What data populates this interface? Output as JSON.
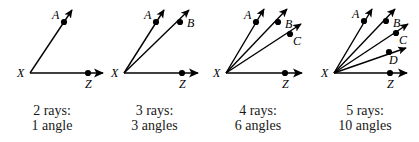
{
  "figure": {
    "background_color": "#ffffff",
    "stroke_color": "#000000",
    "panels": [
      {
        "id": "panel-1",
        "x_offset": 0,
        "width": 104,
        "vertex_label": "X",
        "vertex": {
          "x": 30,
          "y": 73
        },
        "rays": [
          {
            "label": "A",
            "dot": {
              "x": 64,
              "y": 22
            },
            "tip": {
              "x": 72,
              "y": 10
            },
            "label_pos": {
              "x": 52,
              "y": 19
            }
          },
          {
            "label": "Z",
            "dot": {
              "x": 88,
              "y": 73
            },
            "tip": {
              "x": 103,
              "y": 73
            },
            "label_pos": {
              "x": 85,
              "y": 88
            }
          }
        ],
        "caption_line1": "2 rays:",
        "caption_line2": "1 angle",
        "ray_count": 2,
        "angle_count": 1
      },
      {
        "id": "panel-2",
        "x_offset": 104,
        "width": 101,
        "vertex_label": "X",
        "vertex": {
          "x": 20,
          "y": 73
        },
        "rays": [
          {
            "label": "A",
            "dot": {
              "x": 52,
              "y": 22
            },
            "tip": {
              "x": 60,
              "y": 10
            },
            "label_pos": {
              "x": 40,
              "y": 19
            }
          },
          {
            "label": "B",
            "dot": {
              "x": 76,
              "y": 22
            },
            "tip": {
              "x": 85,
              "y": 10
            },
            "label_pos": {
              "x": 83,
              "y": 27
            }
          },
          {
            "label": "Z",
            "dot": {
              "x": 78,
              "y": 73
            },
            "tip": {
              "x": 94,
              "y": 73
            },
            "label_pos": {
              "x": 75,
              "y": 88
            }
          }
        ],
        "caption_line1": "3 rays:",
        "caption_line2": "3 angles",
        "ray_count": 3,
        "angle_count": 3
      },
      {
        "id": "panel-3",
        "x_offset": 205,
        "width": 106,
        "vertex_label": "X",
        "vertex": {
          "x": 21,
          "y": 73
        },
        "rays": [
          {
            "label": "A",
            "dot": {
              "x": 51,
              "y": 22
            },
            "tip": {
              "x": 59,
              "y": 9
            },
            "label_pos": {
              "x": 39,
              "y": 19
            }
          },
          {
            "label": "B",
            "dot": {
              "x": 73,
              "y": 22
            },
            "tip": {
              "x": 82,
              "y": 9
            },
            "label_pos": {
              "x": 80,
              "y": 28
            }
          },
          {
            "label": "C",
            "dot": {
              "x": 85,
              "y": 34
            },
            "tip": {
              "x": 96,
              "y": 24
            },
            "label_pos": {
              "x": 88,
              "y": 45
            }
          },
          {
            "label": "Z",
            "dot": {
              "x": 80,
              "y": 73
            },
            "tip": {
              "x": 97,
              "y": 73
            },
            "label_pos": {
              "x": 77,
              "y": 88
            }
          }
        ],
        "caption_line1": "4 rays:",
        "caption_line2": "6 angles",
        "ray_count": 4,
        "angle_count": 6
      },
      {
        "id": "panel-4",
        "x_offset": 311,
        "width": 108,
        "vertex_label": "X",
        "vertex": {
          "x": 23,
          "y": 73
        },
        "rays": [
          {
            "label": "A",
            "dot": {
              "x": 53,
              "y": 21
            },
            "tip": {
              "x": 61,
              "y": 9
            },
            "label_pos": {
              "x": 41,
              "y": 18
            }
          },
          {
            "label": "B",
            "dot": {
              "x": 75,
              "y": 21
            },
            "tip": {
              "x": 84,
              "y": 9
            },
            "label_pos": {
              "x": 82,
              "y": 27
            }
          },
          {
            "label": "C",
            "dot": {
              "x": 85,
              "y": 33
            },
            "tip": {
              "x": 97,
              "y": 24
            },
            "label_pos": {
              "x": 88,
              "y": 44
            }
          },
          {
            "label": "D",
            "dot": {
              "x": 78,
              "y": 52
            },
            "tip": {
              "x": 95,
              "y": 48
            },
            "label_pos": {
              "x": 78,
              "y": 64
            }
          },
          {
            "label": "Z",
            "dot": {
              "x": 79,
              "y": 73
            },
            "tip": {
              "x": 96,
              "y": 73
            },
            "label_pos": {
              "x": 76,
              "y": 88
            }
          }
        ],
        "caption_line1": "5 rays:",
        "caption_line2": "10 angles",
        "ray_count": 5,
        "angle_count": 10
      }
    ]
  }
}
